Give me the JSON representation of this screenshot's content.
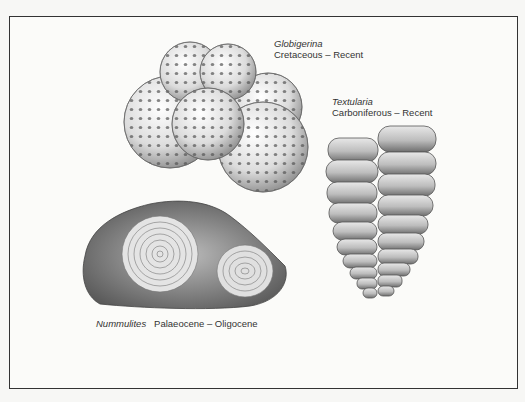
{
  "figure": {
    "specimens": [
      {
        "id": "globigerina",
        "name": "Globigerina",
        "range": "Cretaceous – Recent"
      },
      {
        "id": "textularia",
        "name": "Textularia",
        "range": "Carboniferous – Recent"
      },
      {
        "id": "nummulites",
        "name": "Nummulites",
        "range": "Palaeocene – Oligocene"
      }
    ]
  }
}
